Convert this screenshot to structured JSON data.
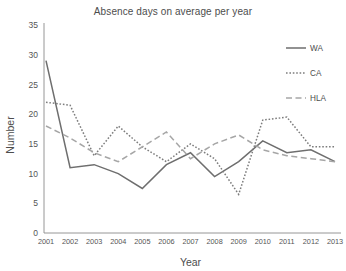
{
  "chart_data": {
    "type": "line",
    "title": "Absence days on average per year",
    "xlabel": "Year",
    "ylabel": "Number",
    "categories": [
      "2001",
      "2002",
      "2003",
      "2004",
      "2005",
      "2006",
      "2007",
      "2008",
      "2009",
      "2010",
      "2011",
      "2012",
      "2013"
    ],
    "x": [
      2001,
      2002,
      2003,
      2004,
      2005,
      2006,
      2007,
      2008,
      2009,
      2010,
      2011,
      2012,
      2013
    ],
    "ylim": [
      0,
      35
    ],
    "yticks": [
      0,
      5,
      10,
      15,
      20,
      25,
      30,
      35
    ],
    "ytick_labels": [
      "0",
      "5",
      "10",
      "15",
      "20",
      "25",
      "30",
      "35"
    ],
    "grid": false,
    "legend_position": "top-right",
    "series": [
      {
        "name": "WA",
        "style": "solid",
        "color": "#6e6e6e",
        "values": [
          29,
          11,
          11.5,
          10,
          7.5,
          11.5,
          13.5,
          9.5,
          12,
          15.5,
          13.5,
          14,
          12
        ]
      },
      {
        "name": "CA",
        "style": "dotted",
        "color": "#7d7d7d",
        "values": [
          22,
          21.5,
          13,
          18,
          14.5,
          12,
          15,
          12.5,
          6.5,
          19,
          19.5,
          14.5,
          14.5
        ]
      },
      {
        "name": "HLA",
        "style": "dashed",
        "color": "#a6a6a6",
        "values": [
          18,
          16,
          13.5,
          12,
          14.5,
          17,
          12.5,
          15,
          16.5,
          14,
          13,
          12.5,
          12
        ]
      }
    ]
  },
  "legend": {
    "items": [
      {
        "label": "WA"
      },
      {
        "label": "CA"
      },
      {
        "label": "HLA"
      }
    ]
  }
}
